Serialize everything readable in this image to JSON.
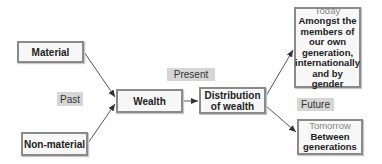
{
  "nodes": {
    "material": "Material",
    "non_material": "Non-material",
    "wealth": "Wealth",
    "distribution_line1": "Distribution",
    "distribution_line2": "of wealth",
    "today": {
      "label": "Today",
      "lines": [
        "Amongst the",
        "members of",
        "our own",
        "generation,",
        "internationally",
        "and by gender"
      ]
    },
    "tomorrow": {
      "label": "Tomorrow",
      "lines": [
        "Between",
        "generations"
      ]
    }
  },
  "tags": {
    "past": "Past",
    "present": "Present",
    "future": "Future"
  },
  "colors": {
    "box_border": "#8a8a8a",
    "box_fill": "#f7f7f7",
    "tag_fill": "#d6d6d6",
    "arrow": "#333333"
  }
}
